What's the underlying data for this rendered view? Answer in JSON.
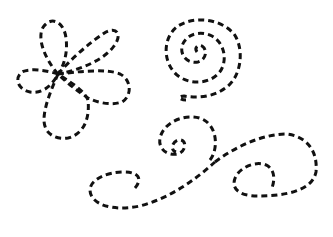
{
  "canvas": {
    "background": "#ffffff",
    "stroke_color": "#111111"
  },
  "shapes": [
    {
      "name": "flower",
      "petals": 5
    },
    {
      "name": "spiral"
    },
    {
      "name": "swirl-flourish"
    }
  ]
}
